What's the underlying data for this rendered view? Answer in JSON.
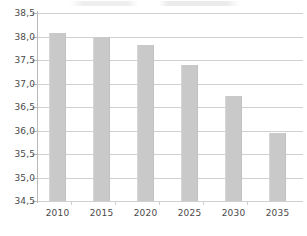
{
  "chart_data": {
    "type": "bar",
    "title": "",
    "subtitle": "",
    "xlabel": "",
    "ylabel": "",
    "categories": [
      "2010",
      "2015",
      "2020",
      "2025",
      "2030",
      "2035"
    ],
    "values": [
      38.07,
      38.0,
      37.81,
      37.4,
      36.74,
      35.94
    ],
    "series": [
      {
        "name": "",
        "values": [
          38.07,
          38.0,
          37.81,
          37.4,
          36.74,
          35.94
        ]
      }
    ],
    "ylim": [
      34.5,
      38.5
    ],
    "ytick_step": 0.5,
    "ytick_labels": [
      "38,5",
      "38,0",
      "37,5",
      "37,0",
      "36,5",
      "36,0",
      "35,5",
      "35,0",
      "34,5"
    ],
    "ytick_values": [
      38.5,
      38.0,
      37.5,
      37.0,
      36.5,
      36.0,
      35.5,
      35.0,
      34.5
    ],
    "xtick_labels": [
      "2010",
      "2015",
      "2020",
      "2025",
      "2030",
      "2035"
    ],
    "grid": true,
    "grid_axis": "y",
    "legend": false,
    "legend_position": "none",
    "decimal_separator": ",",
    "annotations": [],
    "colors": {
      "bar": "#c9c9c9",
      "gridline": "#d0d0d0",
      "axis": "#b9b9b9",
      "tick_text": "#4a4a4a",
      "background": "#ffffff"
    }
  }
}
